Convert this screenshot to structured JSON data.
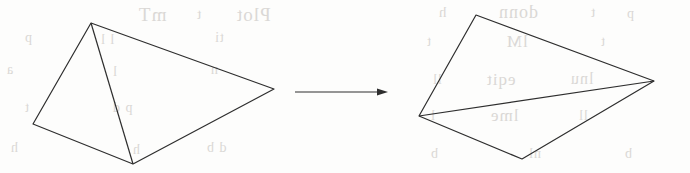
{
  "figure": {
    "background_color": "#fdfdfc",
    "stroke_color": "#2e2e2e",
    "stroke_width": 1.2,
    "canvas": {
      "width": 690,
      "height": 173
    },
    "left_shape": {
      "name": "source-polygon",
      "outline_points": "91,23 274,89 133,164 33,124",
      "diagonal": {
        "x1": 91,
        "y1": 23,
        "x2": 133,
        "y2": 164
      },
      "vertices": [
        {
          "label": "apex",
          "x": 91,
          "y": 23
        },
        {
          "label": "right",
          "x": 274,
          "y": 89
        },
        {
          "label": "bottom",
          "x": 133,
          "y": 164
        },
        {
          "label": "left",
          "x": 33,
          "y": 124
        }
      ]
    },
    "right_shape": {
      "name": "target-polygon",
      "outline_points": "476,15 654,81 522,159 419,116",
      "diagonal": {
        "x1": 419,
        "y1": 116,
        "x2": 654,
        "y2": 81
      },
      "vertices": [
        {
          "label": "apex",
          "x": 476,
          "y": 15
        },
        {
          "label": "right",
          "x": 654,
          "y": 81
        },
        {
          "label": "bottom",
          "x": 522,
          "y": 159
        },
        {
          "label": "left",
          "x": 419,
          "y": 116
        }
      ]
    },
    "arrow": {
      "name": "transformation-arrow",
      "x1": 295,
      "y1": 92,
      "x2": 388,
      "y2": 92,
      "head_length": 11,
      "head_width": 7
    }
  },
  "ghost_text": {
    "color": "#d9d7d4",
    "lines": [
      {
        "text": "Plot",
        "x": 236,
        "y": 4,
        "size": 19
      },
      {
        "text": "mT",
        "x": 138,
        "y": 4,
        "size": 19
      },
      {
        "text": "t",
        "x": 196,
        "y": 6,
        "size": 15
      },
      {
        "text": "p",
        "x": 24,
        "y": 30,
        "size": 14
      },
      {
        "text": "l l",
        "x": 100,
        "y": 32,
        "size": 14
      },
      {
        "text": "ti",
        "x": 214,
        "y": 30,
        "size": 14
      },
      {
        "text": "a",
        "x": 6,
        "y": 62,
        "size": 14
      },
      {
        "text": "l",
        "x": 112,
        "y": 64,
        "size": 14
      },
      {
        "text": "n",
        "x": 210,
        "y": 62,
        "size": 14
      },
      {
        "text": "t",
        "x": 24,
        "y": 100,
        "size": 14
      },
      {
        "text": "p d",
        "x": 112,
        "y": 100,
        "size": 14
      },
      {
        "text": "h",
        "x": 10,
        "y": 140,
        "size": 14
      },
      {
        "text": "h",
        "x": 132,
        "y": 142,
        "size": 14
      },
      {
        "text": "d b",
        "x": 206,
        "y": 140,
        "size": 14
      },
      {
        "text": "h",
        "x": 438,
        "y": 4,
        "size": 15
      },
      {
        "text": "donn",
        "x": 498,
        "y": 2,
        "size": 18
      },
      {
        "text": "t",
        "x": 590,
        "y": 4,
        "size": 15
      },
      {
        "text": "p",
        "x": 626,
        "y": 6,
        "size": 14
      },
      {
        "text": "t",
        "x": 426,
        "y": 34,
        "size": 14
      },
      {
        "text": "lM",
        "x": 506,
        "y": 32,
        "size": 17
      },
      {
        "text": "t",
        "x": 600,
        "y": 34,
        "size": 14
      },
      {
        "text": "ll",
        "x": 432,
        "y": 72,
        "size": 14
      },
      {
        "text": "eqit",
        "x": 486,
        "y": 70,
        "size": 17
      },
      {
        "text": "lnu",
        "x": 570,
        "y": 70,
        "size": 16
      },
      {
        "text": "l",
        "x": 430,
        "y": 108,
        "size": 14
      },
      {
        "text": "lme",
        "x": 490,
        "y": 106,
        "size": 17
      },
      {
        "text": "ll",
        "x": 578,
        "y": 108,
        "size": 14
      },
      {
        "text": "b",
        "x": 430,
        "y": 146,
        "size": 14
      },
      {
        "text": "nl",
        "x": 528,
        "y": 146,
        "size": 14
      },
      {
        "text": "b",
        "x": 624,
        "y": 146,
        "size": 14
      }
    ]
  }
}
